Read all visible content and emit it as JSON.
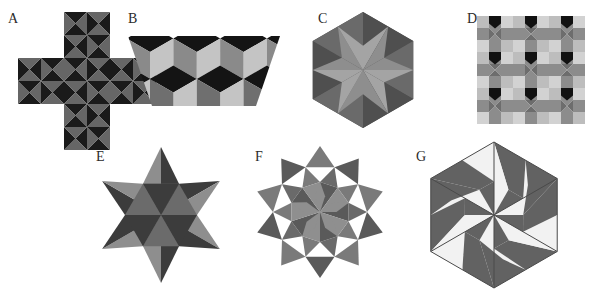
{
  "page": {
    "background": "#ffffff",
    "width": 610,
    "height": 293,
    "label_color": "#2b2b2b"
  },
  "palette": {
    "dark": "#1a1a1a",
    "near_black": "#111111",
    "mid_dark": "#3d3d3d",
    "gray": "#777777",
    "mid_gray": "#6e6e6e",
    "light_gray": "#a9a9a9",
    "pale_gray": "#bdbdbd",
    "very_light": "#d0d0d0",
    "white": "#f7f7f7",
    "outline": "#555555"
  },
  "figures": [
    {
      "id": "A",
      "label": "A",
      "name": "cross-pinwheel-tiling",
      "description": "Greek cross of five blocks, each a 2x2 grid of pinwheel squares",
      "label_x": 8,
      "label_y": 12,
      "x": 18,
      "y": 12,
      "cell": 23,
      "block_cells": 2,
      "colors": [
        "#1a1a1a",
        "#666666"
      ],
      "blocks": [
        [
          1,
          0
        ],
        [
          0,
          1
        ],
        [
          1,
          1
        ],
        [
          2,
          1
        ],
        [
          1,
          2
        ]
      ]
    },
    {
      "id": "B",
      "label": "B",
      "name": "trapezoid-rhombi-tiling",
      "description": "Isosceles trapezoid filled with three-rhombus cube hexagons",
      "label_x": 128,
      "label_y": 12,
      "x": 128,
      "y": 28,
      "width": 148,
      "height": 80,
      "colors": [
        "#141414",
        "#c4c4c4",
        "#8a8a8a",
        "#6f6f6f"
      ]
    },
    {
      "id": "C",
      "label": "C",
      "name": "hexagon-six-point-star",
      "description": "Hexagon containing a six pointed star of alternating light triangles on dark ground",
      "label_x": 318,
      "label_y": 12,
      "cx": 363,
      "cy": 70,
      "r": 58,
      "colors": [
        "#4f4f4f",
        "#8e8e8e",
        "#a4a4a4",
        "#6a6a6a"
      ]
    },
    {
      "id": "D",
      "label": "D",
      "name": "square-pinwheel-grid",
      "description": "Three by three grid of octagonal pinwheel tiles with dark pentagon caps",
      "label_x": 467,
      "label_y": 12,
      "x": 477,
      "y": 16,
      "cell": 36,
      "cols": 3,
      "rows": 3,
      "colors": [
        "#111111",
        "#bdbdbd",
        "#8c8c8c",
        "#6d6d6d",
        "#d2d2d2"
      ]
    },
    {
      "id": "E",
      "label": "E",
      "name": "hexagram-star-triangles",
      "description": "Six pointed star, each of twelve sectors split into light and dark triangles",
      "label_x": 96,
      "label_y": 150,
      "cx": 161,
      "cy": 215,
      "r_outer": 68,
      "r_inner": 36,
      "colors": [
        "#3c3c3c",
        "#8e8e8e",
        "#6b6b6b"
      ]
    },
    {
      "id": "F",
      "label": "F",
      "name": "ten-point-star-rosette",
      "description": "Ten pointed star rosette with radiating triangle pairs",
      "label_x": 255,
      "label_y": 150,
      "cx": 320,
      "cy": 212,
      "r_outer": 66,
      "r_mid": 47,
      "r_inner": 30,
      "points": 10,
      "colors": [
        "#5a5a5a",
        "#8f8f8f",
        "#7a7a7a",
        "#6a6a6a"
      ]
    },
    {
      "id": "G",
      "label": "G",
      "name": "hexagon-pinwheel-gray-white",
      "description": "Hexagon with rotational pinwheel of gray and white quadrilaterals",
      "label_x": 416,
      "label_y": 150,
      "cx": 494,
      "cy": 215,
      "r": 73,
      "colors": [
        "#626262",
        "#f2f2f2",
        "#4a4a4a"
      ]
    }
  ]
}
